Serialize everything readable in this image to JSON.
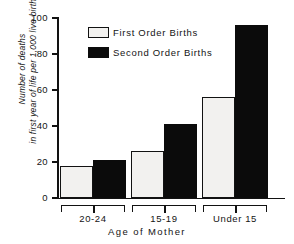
{
  "chart_data": {
    "type": "bar",
    "title": "",
    "xlabel": "Age of Mother",
    "ylabel_line1": "Number of deaths",
    "ylabel_line2": "in first year of life per 1,000 live births",
    "categories": [
      "20-24",
      "15-19",
      "Under 15"
    ],
    "series": [
      {
        "name": "First Order Births",
        "values": [
          18,
          26,
          56
        ],
        "color": "#f2f1ef"
      },
      {
        "name": "Second Order Births",
        "values": [
          21,
          41,
          96
        ],
        "color": "#0b0b0b"
      }
    ],
    "ylim": [
      0,
      100
    ],
    "yticks": [
      0,
      20,
      40,
      60,
      80,
      100
    ],
    "ytick_labels": [
      "0",
      "20",
      "40",
      "60",
      "80",
      "100"
    ],
    "grid": false,
    "legend_position": "upper-center"
  },
  "legend": {
    "items": [
      {
        "label": "First Order Births",
        "swatch": "white-swatch"
      },
      {
        "label": "Second Order Births",
        "swatch": "black-swatch"
      }
    ]
  },
  "axes": {
    "x_title": "Age of Mother",
    "y_title_line1": "Number of deaths",
    "y_title_line2": "in first year of life per 1,000 live births",
    "tick_labels": [
      "100",
      "80",
      "60",
      "40",
      "20",
      "0"
    ],
    "category_labels": [
      "20-24",
      "15-19",
      "Under 15"
    ]
  }
}
